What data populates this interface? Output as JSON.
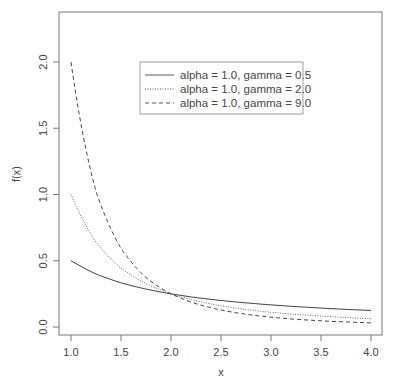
{
  "chart_data": {
    "type": "line",
    "title": "",
    "xlabel": "x",
    "ylabel": "f(x)",
    "xlim": [
      0.9,
      4.1
    ],
    "ylim": [
      -0.05,
      2.3
    ],
    "grid": false,
    "legend_position": "top-center",
    "x_ticks": [
      "1.0",
      "1.5",
      "2.0",
      "2.5",
      "3.0",
      "3.5",
      "4.0"
    ],
    "y_ticks": [
      "0.0",
      "0.5",
      "1.0",
      "1.5",
      "2.0"
    ],
    "x": [
      1.0,
      1.25,
      1.5,
      1.75,
      2.0,
      2.25,
      2.5,
      2.75,
      3.0,
      3.25,
      3.5,
      3.75,
      4.0
    ],
    "series": [
      {
        "name": "alpha = 1.0, gamma = 0.5",
        "style": "solid",
        "gamma": 0.5,
        "values": [
          0.5,
          0.4,
          0.333,
          0.286,
          0.25,
          0.222,
          0.2,
          0.182,
          0.167,
          0.154,
          0.143,
          0.133,
          0.125
        ]
      },
      {
        "name": "alpha = 1.0, gamma = 2.0",
        "style": "dotted",
        "gamma": 2.0,
        "values": [
          1.0,
          0.64,
          0.444,
          0.327,
          0.25,
          0.198,
          0.16,
          0.132,
          0.111,
          0.095,
          0.082,
          0.071,
          0.0625
        ]
      },
      {
        "name": "alpha = 1.0, gamma = 9.0",
        "style": "dashed",
        "gamma": 9.0,
        "values": [
          2.0,
          1.024,
          0.593,
          0.373,
          0.25,
          0.176,
          0.128,
          0.096,
          0.074,
          0.058,
          0.047,
          0.038,
          0.031
        ]
      }
    ]
  },
  "legend": {
    "items": [
      {
        "label": "alpha = 1.0, gamma = 0.5"
      },
      {
        "label": "alpha = 1.0, gamma = 2.0"
      },
      {
        "label": "alpha = 1.0, gamma = 9.0"
      }
    ]
  }
}
